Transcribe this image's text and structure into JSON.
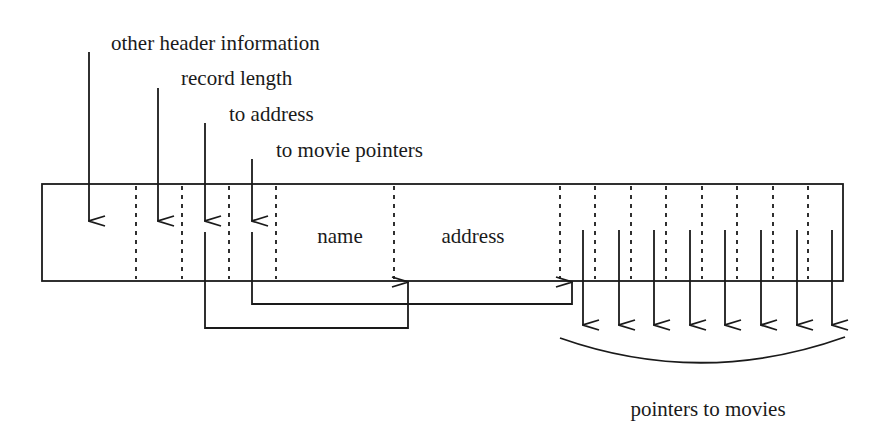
{
  "diagram": {
    "labels": {
      "other_header": "other header information",
      "record_length": "record length",
      "to_address": "to address",
      "to_movie_pointers": "to movie pointers",
      "name_field": "name",
      "address_field": "address",
      "pointers_to_movies": "pointers to movies"
    },
    "record": {
      "box": {
        "x": 42,
        "y": 184,
        "width": 801,
        "height": 97
      },
      "field_dividers_x": [
        136,
        182,
        229,
        276,
        394,
        560,
        595,
        631,
        666,
        702,
        737,
        773,
        808
      ],
      "movie_pointer_count": 8,
      "movie_pointer_arrows_x": [
        583,
        619,
        654,
        690,
        725,
        761,
        797,
        832
      ]
    },
    "header_arrows": [
      {
        "label_key": "other_header",
        "x": 89,
        "y_start": 52
      },
      {
        "label_key": "record_length",
        "x": 158,
        "y_start": 88
      },
      {
        "label_key": "to_address",
        "x": 205,
        "y_start": 123
      },
      {
        "label_key": "to_movie_pointers",
        "x": 252,
        "y_start": 159
      }
    ],
    "connectors": [
      {
        "from": "to_address",
        "to": "address_field",
        "route_y": 328,
        "target_x": 408
      },
      {
        "from": "to_movie_pointers",
        "to": "movie_pointers",
        "route_y": 304,
        "target_x": 572
      }
    ],
    "colors": {
      "ink": "#1a1a1a",
      "background": "#ffffff"
    }
  }
}
